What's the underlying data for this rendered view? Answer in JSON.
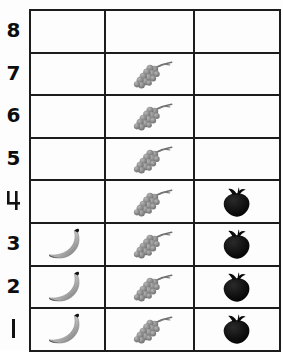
{
  "chart_data": {
    "type": "bar",
    "title": "",
    "subtitle": "",
    "xlabel": "",
    "ylabel": "",
    "grid": true,
    "legend": "none",
    "orientation": "vertical",
    "style": "pictograph-grid",
    "ylim": [
      0,
      8
    ],
    "categories": [
      "banana",
      "grapes",
      "strawberry"
    ],
    "values": [
      3,
      7,
      4
    ],
    "series": [
      {
        "name": "count",
        "values": [
          3,
          7,
          4
        ]
      }
    ],
    "y_ticks": [
      "8",
      "7",
      "6",
      "5",
      "4",
      "3",
      "2",
      "1"
    ],
    "y_tick_values": [
      8,
      7,
      6,
      5,
      4,
      3,
      2,
      1
    ],
    "columns": [
      {
        "icon": "banana-icon",
        "label": "banana",
        "value": 3
      },
      {
        "icon": "grapes-icon",
        "label": "grapes",
        "value": 7
      },
      {
        "icon": "strawberry-icon",
        "label": "strawberry",
        "value": 4
      }
    ],
    "cells": [
      {
        "level": "8",
        "banana": false,
        "grapes": false,
        "strawberry": false
      },
      {
        "level": "7",
        "banana": false,
        "grapes": true,
        "strawberry": false
      },
      {
        "level": "6",
        "banana": false,
        "grapes": true,
        "strawberry": false
      },
      {
        "level": "5",
        "banana": false,
        "grapes": true,
        "strawberry": false
      },
      {
        "level": "4",
        "banana": false,
        "grapes": true,
        "strawberry": true
      },
      {
        "level": "3",
        "banana": true,
        "grapes": true,
        "strawberry": true
      },
      {
        "level": "2",
        "banana": true,
        "grapes": true,
        "strawberry": true
      },
      {
        "level": "1",
        "banana": true,
        "grapes": true,
        "strawberry": true
      }
    ],
    "colors": {
      "grid_line": "#1c1c1c",
      "background": "#fdfdfd",
      "axis_text": "#0d0d0d",
      "banana": "#b9b9b9",
      "banana_tip": "#111111",
      "grapes": "#8e8e8e",
      "strawberry": "#101010"
    }
  }
}
